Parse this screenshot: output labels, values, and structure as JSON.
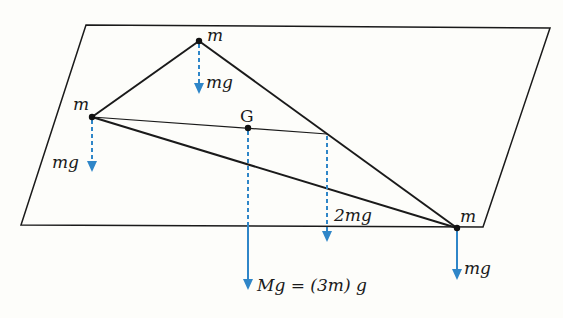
{
  "figure": {
    "colors": {
      "force": "#2f86c8",
      "line": "#1a1a1a",
      "background": "#fdfdfa"
    }
  },
  "plane": {
    "corners": [
      [
        86,
        25
      ],
      [
        550,
        28
      ],
      [
        483,
        227
      ],
      [
        21,
        225
      ]
    ]
  },
  "masses": [
    {
      "id": "top",
      "label": "m",
      "x": 199,
      "y": 41,
      "force_label": "mg",
      "force_end_y": 93,
      "style": "dashed"
    },
    {
      "id": "left",
      "label": "m",
      "x": 92,
      "y": 117,
      "force_label": "mg",
      "force_end_y": 172,
      "style": "dashed"
    },
    {
      "id": "right",
      "label": "m",
      "x": 457,
      "y": 228,
      "force_label": "mg",
      "force_end_y": 280,
      "style": "solid"
    }
  ],
  "centroid": {
    "label": "G",
    "x": 248,
    "y": 128,
    "force_label": "Mg = (3m) g",
    "force_end_y": 290
  },
  "midpoint_force": {
    "x": 327,
    "y": 134,
    "label": "2mg",
    "force_end_y": 242
  }
}
